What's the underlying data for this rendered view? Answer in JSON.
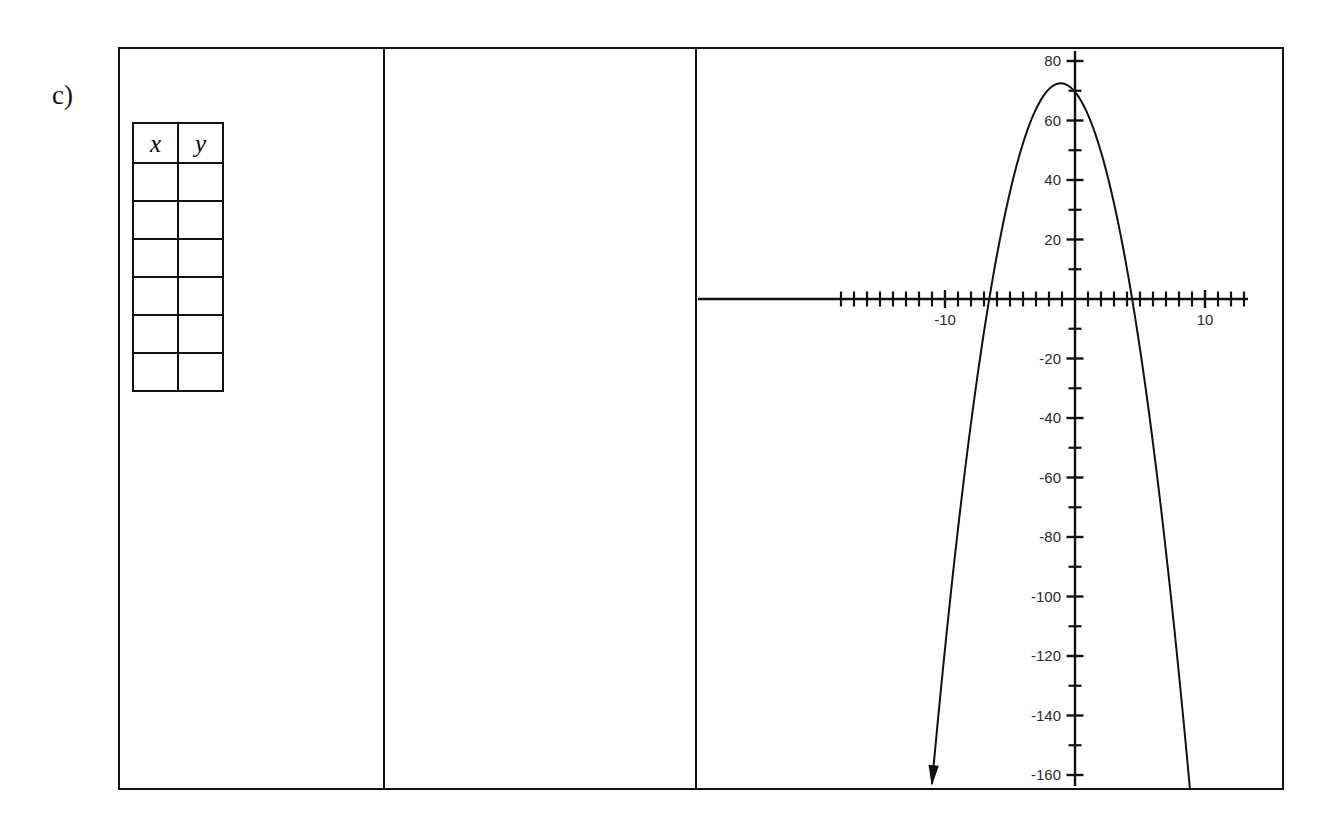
{
  "problem": {
    "label": "c)"
  },
  "table": {
    "name": "xy-value-table",
    "headers": [
      "x",
      "y"
    ],
    "row_count": 6,
    "rows": [
      [
        "",
        ""
      ],
      [
        "",
        ""
      ],
      [
        "",
        ""
      ],
      [
        "",
        ""
      ],
      [
        "",
        ""
      ],
      [
        "",
        ""
      ]
    ]
  },
  "work_panel": {
    "content": ""
  },
  "graph": {
    "arrow_note": "downward arrow on left branch"
  },
  "chart_data": {
    "type": "line",
    "title": "",
    "xlabel": "",
    "ylabel": "",
    "xlim": [
      -18.7,
      23.6
    ],
    "ylim": [
      -166,
      82
    ],
    "grid": false,
    "legend": null,
    "x_tick_interval": 1,
    "x_labeled_ticks": [
      -10,
      10,
      20
    ],
    "x_tick_labels": [
      "-10",
      "10",
      "20"
    ],
    "y_tick_interval": 10,
    "y_labeled_ticks": [
      80,
      60,
      40,
      20,
      -20,
      -40,
      -60,
      -80,
      -100,
      -120,
      -140,
      -160
    ],
    "y_tick_labels": [
      "80",
      "60",
      "40",
      "20",
      "-20",
      "-40",
      "-60",
      "-80",
      "-100",
      "-120",
      "-140",
      "-160"
    ],
    "curve": {
      "shape": "parabola",
      "opens": "down",
      "vertex": [
        -1.1,
        72.5
      ],
      "roots": [
        -7.2,
        5.0
      ],
      "leading_coefficient": -2.4,
      "equation": "y = -2.4(x + 7.2)(x - 5)",
      "arrow_end": [
        -11.0,
        -128.7
      ],
      "series": [
        {
          "name": "parabola",
          "x": [
            -11.0,
            -10.0,
            -9.0,
            -8.0,
            -7.2,
            -6.0,
            -5.0,
            -4.0,
            -3.0,
            -2.0,
            -1.1,
            0.0,
            1.0,
            2.0,
            3.0,
            4.0,
            5.0,
            6.0,
            7.0,
            8.0,
            9.0,
            9.7
          ],
          "y": [
            -128.7,
            -79.2,
            -40.3,
            -12.0,
            0.0,
            26.4,
            43.2,
            53.8,
            58.0,
            55.7,
            72.5,
            86.4,
            76.8,
            61.4,
            40.3,
            13.4,
            0.0,
            -43.2,
            -84.5,
            -131.5,
            -184.3,
            -224.0
          ]
        }
      ]
    }
  }
}
